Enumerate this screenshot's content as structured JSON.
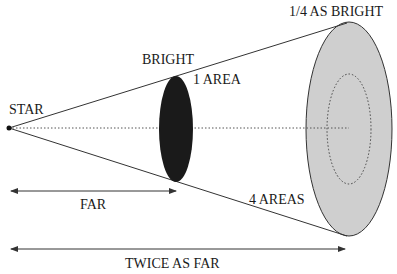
{
  "labels": {
    "star": "STAR",
    "bright": "BRIGHT",
    "one_area": "1 AREA",
    "quarter_bright": "1/4 AS BRIGHT",
    "four_areas": "4 AREAS",
    "far": "FAR",
    "twice_as_far": "TWICE AS FAR"
  },
  "colors": {
    "near_disk": "#1a1a1a",
    "far_disk": "#cfcfcf",
    "lines": "#333333",
    "background": "#ffffff"
  }
}
